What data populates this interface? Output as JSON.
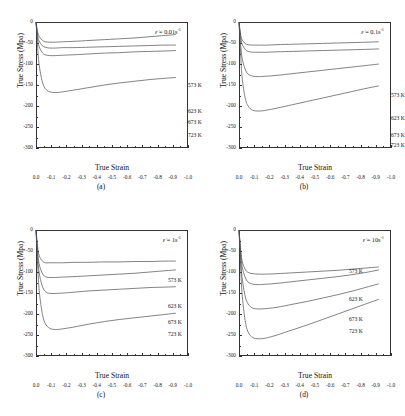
{
  "figure": {
    "background": "#ffffff",
    "curve_color": "#4d4d4d",
    "axis_color": "#333333"
  },
  "axes": {
    "xlabel": "True Strain",
    "ylabel": "True Stress (Mpa)",
    "xticks": [
      "0.0",
      "-0.1",
      "-0.2",
      "-0.3",
      "-0.4",
      "-0.5",
      "-0.6",
      "-0.7",
      "-0.8",
      "-0.9",
      "-1.0"
    ],
    "yticks": [
      "0",
      "-50",
      "-100",
      "-150",
      "-200",
      "-250",
      "-300"
    ],
    "xlim": [
      0.0,
      -1.0
    ],
    "ylim": [
      0,
      -300
    ]
  },
  "panels": [
    {
      "id": "a",
      "caption": "(a)",
      "rate_symbol": "ε̇",
      "rate_equals": " = ",
      "rate_value": "0.01s",
      "rate_exp": "-1"
    },
    {
      "id": "b",
      "caption": "(b)",
      "rate_symbol": "ε̇",
      "rate_equals": " = ",
      "rate_value": "0.1s",
      "rate_exp": "-1"
    },
    {
      "id": "c",
      "caption": "(c)",
      "rate_symbol": "ε̇",
      "rate_equals": " = ",
      "rate_value": "1s",
      "rate_exp": "-1"
    },
    {
      "id": "d",
      "caption": "(d)",
      "rate_symbol": "ε̇",
      "rate_equals": " = ",
      "rate_value": "10s",
      "rate_exp": "-1"
    }
  ],
  "series_labels": [
    "573 K",
    "623 K",
    "673 K",
    "723 K"
  ],
  "chart_data": [
    {
      "type": "line",
      "panel": "a",
      "title": "",
      "annotation": "ε̇ = 0.01s⁻¹",
      "xlabel": "True Strain",
      "ylabel": "True Stress (Mpa)",
      "xlim": [
        0.0,
        -1.0
      ],
      "ylim": [
        0,
        -300
      ],
      "grid": false,
      "legend": "inline-right",
      "x": [
        0.0,
        -0.01,
        -0.02,
        -0.04,
        -0.06,
        -0.09,
        -0.13,
        -0.18,
        -0.25,
        -0.35,
        -0.45,
        -0.55,
        -0.65,
        -0.75,
        -0.85,
        -0.92
      ],
      "series": [
        {
          "name": "573 K",
          "values": [
            0,
            -55,
            -100,
            -140,
            -158,
            -166,
            -168,
            -166,
            -162,
            -156,
            -150,
            -145,
            -141,
            -137,
            -134,
            -132
          ]
        },
        {
          "name": "623 K",
          "values": [
            0,
            -38,
            -58,
            -72,
            -78,
            -80,
            -80,
            -79,
            -78,
            -76,
            -74,
            -73,
            -71,
            -70,
            -69,
            -68
          ]
        },
        {
          "name": "673 K",
          "values": [
            0,
            -30,
            -45,
            -56,
            -60,
            -62,
            -62,
            -61,
            -61,
            -60,
            -59,
            -58,
            -57,
            -56,
            -55,
            -55
          ]
        },
        {
          "name": "723 K",
          "values": [
            0,
            -22,
            -34,
            -43,
            -47,
            -48,
            -48,
            -47,
            -46,
            -44,
            -42,
            -40,
            -38,
            -35,
            -32,
            -30
          ]
        }
      ]
    },
    {
      "type": "line",
      "panel": "b",
      "title": "",
      "annotation": "ε̇ = 0.1s⁻¹",
      "xlabel": "True Strain",
      "ylabel": "True Stress (Mpa)",
      "xlim": [
        0.0,
        -1.0
      ],
      "ylim": [
        0,
        -300
      ],
      "grid": false,
      "legend": "inline-right",
      "x": [
        0.0,
        -0.01,
        -0.02,
        -0.04,
        -0.06,
        -0.09,
        -0.13,
        -0.18,
        -0.25,
        -0.35,
        -0.45,
        -0.55,
        -0.65,
        -0.75,
        -0.85,
        -0.92
      ],
      "series": [
        {
          "name": "573 K",
          "values": [
            0,
            -70,
            -130,
            -180,
            -200,
            -210,
            -212,
            -210,
            -205,
            -197,
            -189,
            -181,
            -173,
            -165,
            -157,
            -152
          ]
        },
        {
          "name": "623 K",
          "values": [
            0,
            -50,
            -85,
            -112,
            -124,
            -129,
            -130,
            -129,
            -127,
            -123,
            -119,
            -115,
            -111,
            -107,
            -103,
            -100
          ]
        },
        {
          "name": "673 K",
          "values": [
            0,
            -33,
            -52,
            -65,
            -70,
            -72,
            -72,
            -72,
            -71,
            -70,
            -69,
            -68,
            -67,
            -66,
            -65,
            -64
          ]
        },
        {
          "name": "723 K",
          "values": [
            0,
            -28,
            -42,
            -51,
            -54,
            -55,
            -55,
            -55,
            -54,
            -53,
            -52,
            -51,
            -50,
            -49,
            -48,
            -47
          ]
        }
      ]
    },
    {
      "type": "line",
      "panel": "c",
      "title": "",
      "annotation": "ε̇ = 1s⁻¹",
      "xlabel": "True Strain",
      "ylabel": "True Stress (Mpa)",
      "xlim": [
        0.0,
        -1.0
      ],
      "ylim": [
        0,
        -300
      ],
      "grid": false,
      "legend": "inline-right",
      "x": [
        0.0,
        -0.01,
        -0.02,
        -0.04,
        -0.06,
        -0.09,
        -0.13,
        -0.18,
        -0.25,
        -0.35,
        -0.45,
        -0.55,
        -0.65,
        -0.75,
        -0.85,
        -0.92
      ],
      "series": [
        {
          "name": "573 K",
          "values": [
            0,
            -75,
            -140,
            -196,
            -222,
            -234,
            -237,
            -235,
            -231,
            -224,
            -218,
            -213,
            -209,
            -205,
            -201,
            -198
          ]
        },
        {
          "name": "623 K",
          "values": [
            0,
            -58,
            -100,
            -132,
            -146,
            -151,
            -151,
            -150,
            -148,
            -145,
            -143,
            -141,
            -139,
            -137,
            -136,
            -135
          ]
        },
        {
          "name": "673 K",
          "values": [
            0,
            -48,
            -80,
            -102,
            -111,
            -113,
            -113,
            -112,
            -111,
            -109,
            -107,
            -105,
            -103,
            -100,
            -97,
            -95
          ]
        },
        {
          "name": "723 K",
          "values": [
            0,
            -38,
            -60,
            -73,
            -78,
            -78,
            -78,
            -78,
            -77,
            -77,
            -76,
            -76,
            -75,
            -75,
            -74,
            -74
          ]
        }
      ]
    },
    {
      "type": "line",
      "panel": "d",
      "title": "",
      "annotation": "ε̇ = 10s⁻¹",
      "xlabel": "True Strain",
      "ylabel": "True Stress (Mpa)",
      "xlim": [
        0.0,
        -1.0
      ],
      "ylim": [
        0,
        -300
      ],
      "grid": false,
      "legend": "inline-right",
      "x": [
        0.0,
        -0.01,
        -0.02,
        -0.04,
        -0.06,
        -0.09,
        -0.13,
        -0.18,
        -0.25,
        -0.35,
        -0.45,
        -0.55,
        -0.65,
        -0.75,
        -0.85,
        -0.92
      ],
      "series": [
        {
          "name": "573 K",
          "values": [
            0,
            -80,
            -150,
            -215,
            -243,
            -256,
            -259,
            -257,
            -250,
            -238,
            -226,
            -213,
            -200,
            -187,
            -174,
            -165
          ]
        },
        {
          "name": "623 K",
          "values": [
            0,
            -62,
            -112,
            -157,
            -176,
            -186,
            -188,
            -187,
            -184,
            -177,
            -170,
            -162,
            -154,
            -145,
            -135,
            -128
          ]
        },
        {
          "name": "673 K",
          "values": [
            0,
            -48,
            -86,
            -112,
            -124,
            -129,
            -130,
            -129,
            -127,
            -123,
            -119,
            -115,
            -111,
            -106,
            -100,
            -95
          ]
        },
        {
          "name": "723 K",
          "values": [
            0,
            -42,
            -73,
            -93,
            -101,
            -104,
            -105,
            -105,
            -104,
            -102,
            -100,
            -98,
            -96,
            -93,
            -90,
            -88
          ]
        }
      ]
    }
  ],
  "temp_label_positions": {
    "a": [
      {
        "t": "573 K",
        "x": 152,
        "y": 60
      },
      {
        "t": "623 K",
        "x": 152,
        "y": 86
      },
      {
        "t": "673 K",
        "x": 152,
        "y": 97
      },
      {
        "t": "723 K",
        "x": 152,
        "y": 110
      }
    ],
    "b": [
      {
        "t": "573 K",
        "x": 152,
        "y": 70
      },
      {
        "t": "623 K",
        "x": 152,
        "y": 93
      },
      {
        "t": "673 K",
        "x": 152,
        "y": 110
      },
      {
        "t": "723 K",
        "x": 152,
        "y": 120
      }
    ],
    "c": [
      {
        "t": "573 K",
        "x": 132,
        "y": 47
      },
      {
        "t": "623 K",
        "x": 132,
        "y": 73
      },
      {
        "t": "673 K",
        "x": 132,
        "y": 89
      },
      {
        "t": "723 K",
        "x": 132,
        "y": 101
      }
    ],
    "d": [
      {
        "t": "573 K",
        "x": 110,
        "y": 38
      },
      {
        "t": "623 K",
        "x": 110,
        "y": 66
      },
      {
        "t": "673 K",
        "x": 110,
        "y": 86
      },
      {
        "t": "723 K",
        "x": 110,
        "y": 98
      }
    ]
  }
}
